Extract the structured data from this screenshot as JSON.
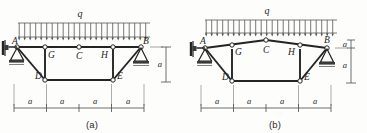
{
  "figures": [
    {
      "id": "figure-a",
      "caption": "(a)",
      "load": {
        "symbol": "q",
        "type": "uniform-distributed-load",
        "arrow_count": 24
      },
      "joint_labels": [
        "A",
        "G",
        "C",
        "H",
        "B",
        "D",
        "E"
      ],
      "supports": [
        {
          "at": "A",
          "kind": "pin-support-wall"
        },
        {
          "at": "B",
          "kind": "pin-support-ground"
        }
      ],
      "horizontal_dims": [
        "a",
        "a",
        "a",
        "a"
      ],
      "vertical_dims": [
        "a"
      ],
      "members": [
        "A-B",
        "A-D",
        "D-G",
        "G-C",
        "C-H",
        "H-E",
        "D-E",
        "E-B"
      ],
      "hinges": [
        "G",
        "C",
        "H",
        "D",
        "E",
        "A",
        "B"
      ]
    },
    {
      "id": "figure-b",
      "caption": "(b)",
      "load": {
        "symbol": "q",
        "type": "uniform-distributed-load",
        "arrow_count": 24
      },
      "joint_labels": [
        "A",
        "G",
        "C",
        "H",
        "B",
        "D",
        "E"
      ],
      "supports": [
        {
          "at": "A",
          "kind": "pin-support-wall"
        },
        {
          "at": "B",
          "kind": "pin-support-ground"
        }
      ],
      "horizontal_dims": [
        "a",
        "a",
        "a",
        "a"
      ],
      "vertical_dims": [
        "a",
        "a"
      ],
      "members": [
        "A-C",
        "C-B",
        "A-D",
        "D-G",
        "G-C",
        "C-H",
        "H-E",
        "D-E",
        "E-B"
      ],
      "hinges": [
        "G",
        "C",
        "H",
        "D",
        "E",
        "A",
        "B"
      ]
    }
  ],
  "colors": {
    "line": "#242424",
    "load_line": "#6c6c6c",
    "dim_line": "#4a4a4a",
    "node_fill": "#ffffff",
    "page_bg": "#fdfdfc"
  }
}
